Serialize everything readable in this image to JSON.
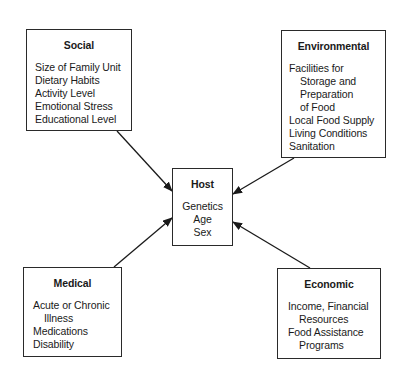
{
  "diagram": {
    "center": {
      "title": "Host",
      "items": [
        "Genetics",
        "Age",
        "Sex"
      ]
    },
    "factors": {
      "social": {
        "title": "Social",
        "items": [
          "Size of Family Unit",
          "Dietary Habits",
          "Activity Level",
          "Emotional Stress",
          "Educational Level"
        ]
      },
      "environmental": {
        "title": "Environmental",
        "items": [
          "Facilities for",
          "Storage and",
          "Preparation",
          "of Food",
          "Local Food Supply",
          "Living Conditions",
          "Sanitation"
        ]
      },
      "medical": {
        "title": "Medical",
        "items": [
          "Acute or Chronic",
          "Illness",
          "Medications",
          "Disability"
        ]
      },
      "economic": {
        "title": "Economic",
        "items": [
          "Income, Financial",
          "Resources",
          "Food Assistance",
          "Programs"
        ]
      }
    },
    "edges": [
      {
        "from": "social",
        "to": "host"
      },
      {
        "from": "environmental",
        "to": "host"
      },
      {
        "from": "medical",
        "to": "host"
      },
      {
        "from": "economic",
        "to": "host"
      }
    ],
    "colors": {
      "line": "#1a1a1a",
      "background": "#ffffff"
    }
  }
}
